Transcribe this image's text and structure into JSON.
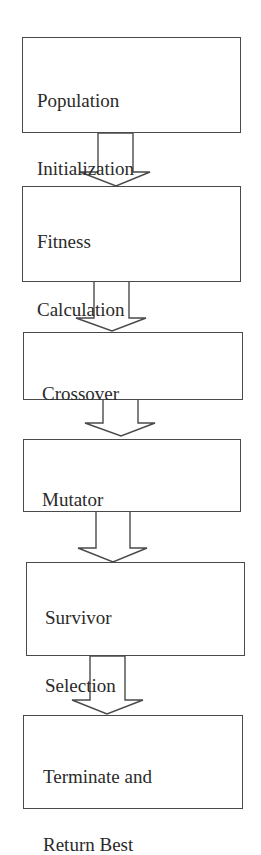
{
  "diagram": {
    "type": "flowchart",
    "direction": "top-to-bottom",
    "steps": [
      {
        "id": "population-initialization",
        "lines": [
          "Population",
          "Initialization"
        ]
      },
      {
        "id": "fitness-calculation",
        "lines": [
          "Fitness",
          "Calculation"
        ]
      },
      {
        "id": "crossover",
        "lines": [
          "Crossover"
        ]
      },
      {
        "id": "mutator",
        "lines": [
          "Mutator"
        ]
      },
      {
        "id": "survivor-selection",
        "lines": [
          "Survivor",
          "Selection"
        ]
      },
      {
        "id": "terminate-return-best",
        "lines": [
          "Terminate and",
          "Return Best"
        ]
      }
    ],
    "edges": [
      {
        "from": "population-initialization",
        "to": "fitness-calculation"
      },
      {
        "from": "fitness-calculation",
        "to": "crossover"
      },
      {
        "from": "crossover",
        "to": "mutator"
      },
      {
        "from": "mutator",
        "to": "survivor-selection"
      },
      {
        "from": "survivor-selection",
        "to": "terminate-return-best"
      }
    ]
  }
}
